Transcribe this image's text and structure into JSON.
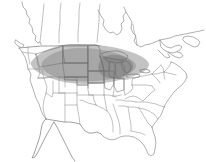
{
  "figure": {
    "kind": "range-map",
    "width": 206,
    "height": 162,
    "background_color": "#ffffff",
    "has_visible_text": false,
    "has_legend": false,
    "has_border": false
  },
  "map": {
    "region": "North America",
    "projection_look": "conic",
    "base_features": [
      "United States state boundaries",
      "Canada outline",
      "Mexico outline",
      "Great Lakes",
      "Atlantic coastline",
      "Pacific coastline",
      "Gulf of Mexico coastline",
      "Baja California peninsula",
      "Florida peninsula",
      "Maritime provinces"
    ],
    "colors": {
      "land": "#ffffff",
      "coastline": "#7c7c7c",
      "state_border": "#8d8d8d",
      "country_border": "#6e6e6e",
      "range_light": "#b9b9b9",
      "range_core": "#9e9e9e",
      "range_dark": "#8a8a8a"
    }
  },
  "range": {
    "label": "shaded distribution range",
    "shape": "lens / elongated ellipse oriented west-northwest to east-southeast",
    "extent_description": "Upper Midwest and northern Great Plains, from Montana and Idaho east to the Great Lakes and lower Michigan",
    "states_covered": [
      "Montana",
      "North Dakota",
      "South Dakota",
      "Nebraska",
      "Minnesota",
      "Iowa",
      "Wisconsin",
      "Illinois",
      "Michigan",
      "northern Indiana"
    ],
    "states_partial": [
      "Idaho",
      "Wyoming",
      "Missouri",
      "Ohio",
      "Kansas"
    ],
    "density_levels": [
      {
        "name": "outer",
        "color": "#b9b9b9",
        "note": "light grey feathered edge over the plains"
      },
      {
        "name": "core",
        "color": "#9e9e9e",
        "note": "mid grey over the Dakotas, Nebraska, Iowa, Minnesota"
      },
      {
        "name": "densest",
        "color": "#8a8a8a",
        "note": "dark grey concentration around Wisconsin, Michigan and the Great Lakes"
      }
    ]
  }
}
